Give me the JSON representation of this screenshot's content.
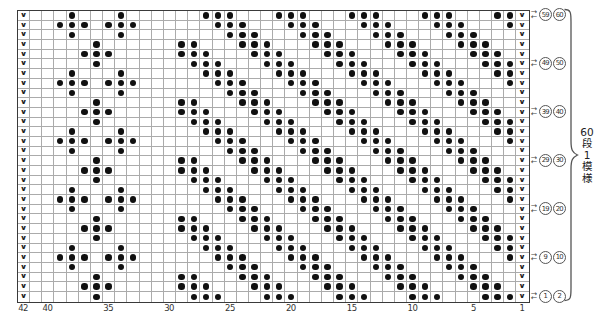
{
  "chart": {
    "kind": "knitting-colorwork-chart",
    "columns": 42,
    "rows": 30,
    "pattern_note_vertical": [
      "60",
      "段",
      "1",
      "模",
      "様"
    ],
    "symbols": {
      "slip_stitch": "∨",
      "contrast_dot": "●"
    },
    "colors": {
      "dot": "#101010",
      "grid_line": "#ababab",
      "border": "#3a3a3a",
      "text": "#333333"
    },
    "grid_rows": [
      "V...O...O......OOO...OOO...OOO...OOO...OOV",
      "V..OOO.OOO......OOO...OOO...OOO...OOO...OV",
      "V...O...O........OOO...OOO...OOO...OOO...V",
      "V.....O......OO...OOO...OOO...OOO...OOO..V",
      "V....OOO.....OOO...OOO...OOO...OOO...OOO.V",
      "V.....O.......OOO...OOO...OOO...OOO...OOOV",
      "V...O...O......OOO...OOO...OOO...OOO...OOV",
      "V..OOO.OOO......OOO...OOO...OOO...OOO...OV",
      "V...O...O........OOO...OOO...OOO...OOO...V",
      "V.....O......OO...OOO...OOO...OOO...OOO..V",
      "V....OOO.....OOO...OOO...OOO...OOO...OOO.V",
      "V.....O.......OOO...OOO...OOO...OOO...OOOV",
      "V...O...O......OOO...OOO...OOO...OOO...OOV",
      "V..OOO.OOO......OOO...OOO...OOO...OOO...OV",
      "V...O...O........OOO...OOO...OOO...OOO...V",
      "V.....O......OO...OOO...OOO...OOO...OOO..V",
      "V....OOO.....OOO...OOO...OOO...OOO...OOO.V",
      "V.....O.......OOO...OOO...OOO...OOO...OOOV",
      "V...O...O......OOO...OOO...OOO...OOO...OOV",
      "V..OOO.OOO......OOO...OOO...OOO...OOO...OV",
      "V...O...O........OOO...OOO...OOO...OOO...V",
      "V.....O......OO...OOO...OOO...OOO...OOO..V",
      "V....OOO.....OOO...OOO...OOO...OOO...OOO.V",
      "V.....O.......OOO...OOO...OOO...OOO...OOOV",
      "V...O...O......OOO...OOO...OOO...OOO...OOV",
      "V..OOO.OOO......OOO...OOO...OOO...OOO...OV",
      "V...O...O........OOO...OOO...OOO...OOO...V",
      "V.....O......OO...OOO...OOO...OOO...OOO..V",
      "V....OOO.....OOO...OOO...OOO...OOO...OOO.V",
      "V.....O.......OOO...OOO...OOO...OOO...OOOV"
    ],
    "bottom_labels": [
      {
        "text": "42",
        "col": 42
      },
      {
        "text": "40",
        "col": 40
      },
      {
        "text": "35",
        "col": 35
      },
      {
        "text": "30",
        "col": 30
      },
      {
        "text": "25",
        "col": 25
      },
      {
        "text": "20",
        "col": 20
      },
      {
        "text": "15",
        "col": 15
      },
      {
        "text": "10",
        "col": 10
      },
      {
        "text": "5",
        "col": 5
      },
      {
        "text": "1",
        "col": 1
      }
    ],
    "row_markers": [
      {
        "row": 1,
        "labels": [
          "59",
          "60"
        ]
      },
      {
        "row": 6,
        "labels": [
          "49",
          "50"
        ]
      },
      {
        "row": 11,
        "labels": [
          "39",
          "40"
        ]
      },
      {
        "row": 16,
        "labels": [
          "29",
          "30"
        ]
      },
      {
        "row": 21,
        "labels": [
          "19",
          "20"
        ]
      },
      {
        "row": 26,
        "labels": [
          "9",
          "10"
        ]
      },
      {
        "row": 30,
        "labels": [
          "1",
          "2"
        ]
      }
    ],
    "arrow_right": "→",
    "arrow_left": "←"
  },
  "layout_constants": {
    "grid_left": 17,
    "grid_top": 10,
    "cell_w": 12.17,
    "cell_h": 9.7
  }
}
